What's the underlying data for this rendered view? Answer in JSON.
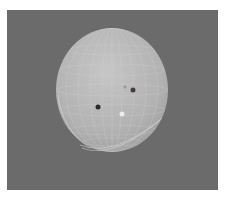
{
  "scene": {
    "background_color": "#6b6b6b",
    "object": "wireframe-sphere",
    "sphere": {
      "cx": 112,
      "cy": 90,
      "rx": 56,
      "ry": 62,
      "fill": "#b4b4b4",
      "highlight": "#c9c9c9",
      "wire_color": "#d8d8d8"
    },
    "markers": [
      {
        "name": "dark-point",
        "cx": 98,
        "cy": 107,
        "r": 2.5,
        "color": "#2a2a2a"
      },
      {
        "name": "brown-point",
        "cx": 133,
        "cy": 90,
        "r": 2.5,
        "color": "#4a3a3a"
      },
      {
        "name": "faint-point",
        "cx": 125,
        "cy": 87,
        "r": 1.5,
        "color": "#9a9a9a"
      },
      {
        "name": "white-point",
        "cx": 122,
        "cy": 114,
        "r": 2.5,
        "color": "#eeeeee"
      }
    ]
  }
}
